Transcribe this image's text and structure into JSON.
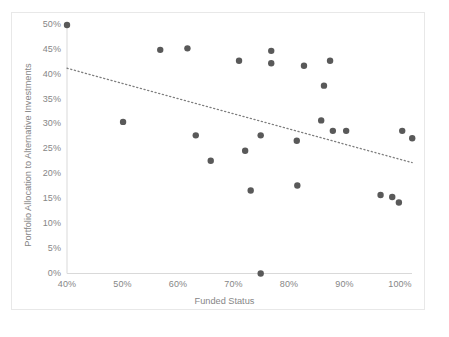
{
  "chart_data": {
    "type": "scatter",
    "title": "",
    "xlabel": "Funded Status",
    "ylabel": "Portfolio Allocation to Alternative Investments",
    "xlim": [
      40,
      100
    ],
    "ylim": [
      0,
      50
    ],
    "xticks": [
      "40%",
      "50%",
      "60%",
      "70%",
      "80%",
      "90%",
      "100%"
    ],
    "xtick_values": [
      40,
      50,
      60,
      70,
      80,
      90,
      100
    ],
    "yticks": [
      "0%",
      "5%",
      "10%",
      "15%",
      "20%",
      "25%",
      "30%",
      "35%",
      "40%",
      "45%",
      "50%"
    ],
    "ytick_values": [
      0,
      5,
      10,
      15,
      20,
      25,
      30,
      35,
      40,
      45,
      50
    ],
    "grid": false,
    "legend": "none",
    "marker_color": "#595959",
    "axis_color": "#d9d9d9",
    "trendline_color": "#7f7f7f",
    "points": [
      {
        "x": 40.0,
        "y": 50.0
      },
      {
        "x": 50.1,
        "y": 30.5
      },
      {
        "x": 56.8,
        "y": 45.0
      },
      {
        "x": 61.7,
        "y": 45.3
      },
      {
        "x": 63.2,
        "y": 27.8
      },
      {
        "x": 65.9,
        "y": 22.7
      },
      {
        "x": 71.0,
        "y": 42.8
      },
      {
        "x": 72.1,
        "y": 24.7
      },
      {
        "x": 73.1,
        "y": 16.7
      },
      {
        "x": 74.9,
        "y": 27.8
      },
      {
        "x": 74.9,
        "y": 0.0
      },
      {
        "x": 76.8,
        "y": 44.8
      },
      {
        "x": 76.8,
        "y": 42.3
      },
      {
        "x": 81.4,
        "y": 26.7
      },
      {
        "x": 81.5,
        "y": 17.7
      },
      {
        "x": 82.7,
        "y": 41.8
      },
      {
        "x": 85.8,
        "y": 30.8
      },
      {
        "x": 86.3,
        "y": 37.8
      },
      {
        "x": 87.4,
        "y": 42.8
      },
      {
        "x": 87.9,
        "y": 28.7
      },
      {
        "x": 90.3,
        "y": 28.7
      },
      {
        "x": 98.6,
        "y": 15.4
      },
      {
        "x": 100.4,
        "y": 28.7
      },
      {
        "x": 102.2,
        "y": 27.2
      },
      {
        "x": 96.5,
        "y": 15.8
      },
      {
        "x": 99.8,
        "y": 14.3
      }
    ],
    "trendline": {
      "style": "dotted",
      "x_start": 40.0,
      "y_start": 41.3,
      "x_end": 102.2,
      "y_end": 22.3
    }
  }
}
